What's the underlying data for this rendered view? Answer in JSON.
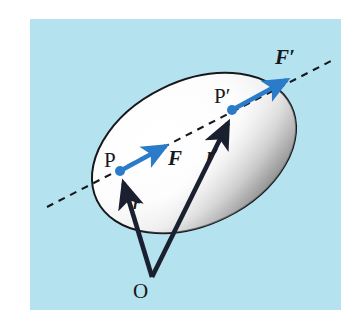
{
  "figure": {
    "type": "physics-vector-diagram",
    "background_color": "#b4e2ee",
    "page_color": "#ffffff",
    "body_fill": "#ffffff",
    "body_outline_color": "#1a1a1a",
    "body_shade_color": "#9a9a9a",
    "force_vector_color": "#2a7bc8",
    "position_vector_color": "#1b2030",
    "line_of_action_color": "#15181e"
  },
  "points": {
    "P": {
      "label": "P",
      "x": 120,
      "y": 171,
      "label_x": 104,
      "label_y": 150,
      "dot_color": "#2a7bc8"
    },
    "P_prime": {
      "label": "P′",
      "x": 232,
      "y": 110,
      "label_x": 214,
      "label_y": 86,
      "dot_color": "#2a7bc8"
    },
    "O": {
      "label": "O",
      "x": 152,
      "y": 277,
      "label_x": 133,
      "label_y": 281
    }
  },
  "vectors": [
    {
      "name": "F",
      "label": "F",
      "label_x": 168,
      "label_y": 148,
      "color": "#2a7bc8",
      "from_x": 120,
      "from_y": 171,
      "to_x": 171,
      "to_y": 143,
      "kind": "force"
    },
    {
      "name": "F_prime",
      "label": "F′",
      "label_x": 275,
      "label_y": 47,
      "color": "#2a7bc8",
      "from_x": 232,
      "from_y": 110,
      "to_x": 292,
      "to_y": 77,
      "kind": "force"
    },
    {
      "name": "r",
      "label": "r",
      "label_x": 133,
      "label_y": 195,
      "color": "#1b2030",
      "from_x": 152,
      "from_y": 277,
      "to_x": 122,
      "to_y": 180,
      "kind": "position"
    },
    {
      "name": "r_prime",
      "label": "r′",
      "label_x": 207,
      "label_y": 146,
      "color": "#1b2030",
      "from_x": 152,
      "from_y": 277,
      "to_x": 230,
      "to_y": 119,
      "kind": "position"
    }
  ],
  "line_of_action": {
    "name": "line-of-action",
    "style": "dashed",
    "from_x": 47,
    "from_y": 207,
    "to_x": 331,
    "to_y": 61
  },
  "body": {
    "name": "rigid-body-ellipse",
    "center_x": 194,
    "center_y": 153,
    "radius_x": 108,
    "radius_y": 72,
    "rotation_deg": -26
  }
}
